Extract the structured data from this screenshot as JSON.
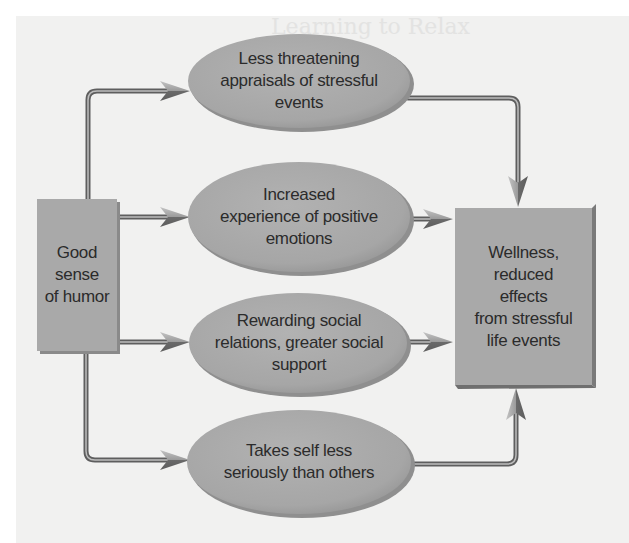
{
  "diagram": {
    "type": "flowchart",
    "source_node": {
      "id": "humor",
      "label": "Good\nsense\nof humor"
    },
    "mediators": [
      {
        "id": "appraisals",
        "label": "Less threatening\nappraisals of stressful\nevents"
      },
      {
        "id": "positive-emotions",
        "label": "Increased\nexperience of positive\nemotions"
      },
      {
        "id": "social-support",
        "label": "Rewarding social\nrelations, greater social\nsupport"
      },
      {
        "id": "self-seriousness",
        "label": "Takes self less\nseriously than others"
      }
    ],
    "outcome_node": {
      "id": "wellness",
      "label": "Wellness,\nreduced\neffects\nfrom stressful\nlife events"
    },
    "edges": [
      {
        "from": "humor",
        "to": "appraisals"
      },
      {
        "from": "humor",
        "to": "positive-emotions"
      },
      {
        "from": "humor",
        "to": "social-support"
      },
      {
        "from": "humor",
        "to": "self-seriousness"
      },
      {
        "from": "appraisals",
        "to": "wellness"
      },
      {
        "from": "positive-emotions",
        "to": "wellness"
      },
      {
        "from": "social-support",
        "to": "wellness"
      },
      {
        "from": "self-seriousness",
        "to": "wellness"
      }
    ],
    "colors": {
      "node_fill": "#a9a9a9",
      "node_shadow": "#7d7d7d",
      "connector": "#6e6e6e",
      "arrow_light": "#b8b8b8",
      "arrow_dark": "#6a6a6a",
      "text": "#2b2b2b",
      "page_bg": "#f1f1f0"
    }
  },
  "background_text": {
    "heading": "Learning to Relax"
  }
}
